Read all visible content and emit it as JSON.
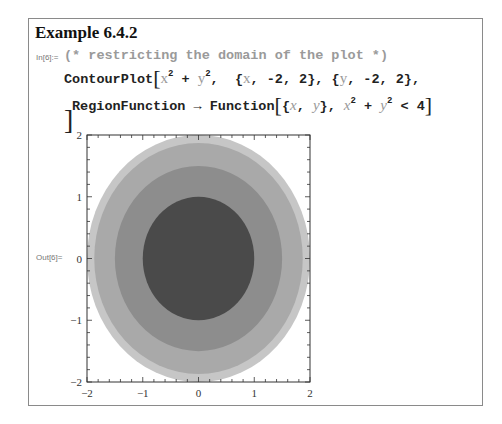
{
  "cell": {
    "title": "Example 6.4.2",
    "in_label": "In[6]:=",
    "out_label": "Out[6]=",
    "comment": "(* restricting the domain of the plot *)",
    "line1": {
      "func": "ContourPlot",
      "expr_x": "x",
      "expr_y": "y",
      "exp": "2",
      "plus": " + ",
      "range_x": "{x, -2, 2}",
      "range_y": "{y, -2, 2}",
      "range_x_open": "{",
      "range_x_var": "x",
      "range_x_rest": ", -2, 2}",
      "range_y_open": "{",
      "range_y_var": "y",
      "range_y_rest": ", -2, 2},"
    },
    "line2": {
      "option": "RegionFunction",
      "arrow": "→",
      "func": "Function",
      "args_open": "{",
      "arg_x": "x",
      "arg_sep": ", ",
      "arg_y": "y",
      "args_close": "},",
      "cond_x": "x",
      "cond_y": "y",
      "cond_rest": "< 4"
    },
    "closing_bracket": "]"
  },
  "chart_data": {
    "type": "heatmap",
    "subtype": "contour",
    "title": "",
    "function": "x^2 + y^2",
    "region": "x^2 + y^2 < 4",
    "xlim": [
      -2,
      2
    ],
    "ylim": [
      -2,
      2
    ],
    "x_ticks": [
      "-2",
      "-1",
      "0",
      "1",
      "2"
    ],
    "y_ticks": [
      "-2",
      "-1",
      "0",
      "1",
      "2"
    ],
    "contour_radii_estimate": [
      1.0,
      1.5,
      1.87,
      2.0
    ],
    "fill_colors": [
      "#4a4a4a",
      "#8d8d8d",
      "#a9a9a9",
      "#c6c6c6"
    ],
    "background": "#ffffff",
    "frame": true,
    "grid": false
  }
}
